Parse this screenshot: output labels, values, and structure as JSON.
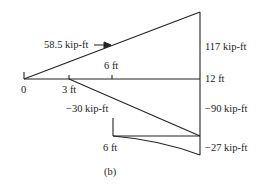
{
  "diagram": {
    "caption": "(b)",
    "upper": {
      "slope_label": "58.5 kip-ft",
      "max_label": "117 kip-ft"
    },
    "axis": {
      "origin_label": "0",
      "tick_3": "3 ft",
      "tick_6": "6 ft",
      "end_label": "12 ft"
    },
    "lower": {
      "left_label": "−30 kip-ft",
      "right_label": "−90 kip-ft",
      "bracket_label": "6 ft",
      "bottom_label": "−27 kip-ft"
    },
    "colors": {
      "line": "#222222",
      "background": "#ffffff"
    }
  }
}
